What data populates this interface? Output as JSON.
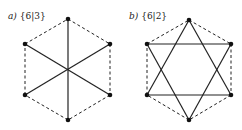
{
  "diagrams": [
    {
      "id": "a",
      "label_letter": "a)",
      "label_symbol": "{6|3}",
      "vertices": [
        [
          68,
          19
        ],
        [
          110,
          44
        ],
        [
          110,
          95
        ],
        [
          68,
          120
        ],
        [
          25,
          95
        ],
        [
          25,
          44
        ]
      ],
      "center": [
        68,
        70
      ],
      "solid_edges": [
        [
          0,
          3
        ],
        [
          1,
          4
        ],
        [
          2,
          5
        ]
      ],
      "dashed_edges": [
        [
          0,
          1
        ],
        [
          1,
          2
        ],
        [
          2,
          3
        ],
        [
          3,
          4
        ],
        [
          4,
          5
        ],
        [
          5,
          0
        ]
      ]
    },
    {
      "id": "b",
      "label_letter": "b)",
      "label_symbol": "{6|2}",
      "vertices": [
        [
          189,
          20
        ],
        [
          231,
          44
        ],
        [
          231,
          95
        ],
        [
          189,
          120
        ],
        [
          147,
          95
        ],
        [
          147,
          44
        ]
      ],
      "solid_edges": [
        [
          0,
          2
        ],
        [
          2,
          4
        ],
        [
          4,
          0
        ],
        [
          1,
          3
        ],
        [
          3,
          5
        ],
        [
          5,
          1
        ]
      ],
      "dashed_edges": [
        [
          0,
          1
        ],
        [
          1,
          2
        ],
        [
          2,
          3
        ],
        [
          3,
          4
        ],
        [
          4,
          5
        ],
        [
          5,
          0
        ]
      ]
    }
  ],
  "colors": {
    "line": "#222222",
    "vertex": "#111111",
    "background": "#ffffff"
  }
}
